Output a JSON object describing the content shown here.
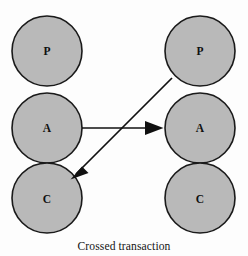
{
  "figure": {
    "caption": "Crossed transaction",
    "background_color": "#fdfdfd",
    "node_fill_color": "#b9b9b9",
    "node_stroke_color": "#1a1a1a",
    "edge_color": "#101010",
    "width": 248,
    "height": 256
  },
  "columns": [
    {
      "name": "left-person",
      "nodes": [
        {
          "label": "P",
          "role": "parent",
          "cx": 47,
          "cy": 51,
          "r": 35
        },
        {
          "label": "A",
          "role": "adult",
          "cx": 47,
          "cy": 128,
          "r": 35
        },
        {
          "label": "C",
          "role": "child",
          "cx": 47,
          "cy": 198,
          "r": 35
        }
      ]
    },
    {
      "name": "right-person",
      "nodes": [
        {
          "label": "P",
          "role": "parent",
          "cx": 200,
          "cy": 51,
          "r": 35
        },
        {
          "label": "A",
          "role": "adult",
          "cx": 200,
          "cy": 128,
          "r": 35
        },
        {
          "label": "C",
          "role": "child",
          "cx": 200,
          "cy": 198,
          "r": 35
        }
      ]
    }
  ],
  "edges": [
    {
      "name": "stimulus-adult-to-adult",
      "from": "left-adult",
      "to": "right-adult",
      "x1": 82,
      "y1": 128,
      "x2": 163,
      "y2": 128
    },
    {
      "name": "response-parent-to-child",
      "from": "right-parent",
      "to": "left-child",
      "x1": 172,
      "y1": 78,
      "x2": 71,
      "y2": 179
    }
  ]
}
